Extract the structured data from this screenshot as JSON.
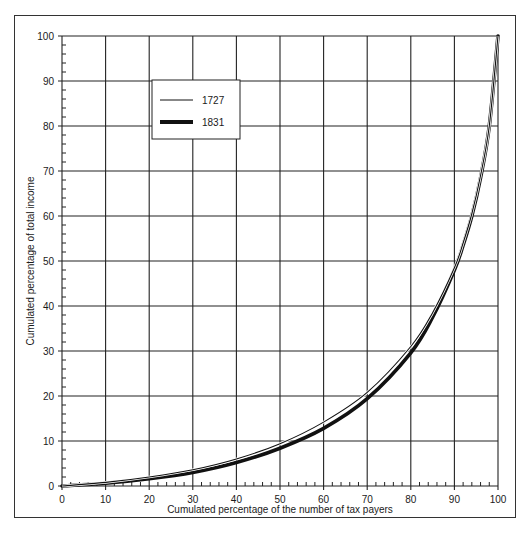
{
  "chart_data": {
    "type": "line",
    "title": "",
    "xlabel": "Cumulated percentage of the number of tax payers",
    "ylabel": "Cumulated percentage of total income",
    "xlim": [
      0,
      100
    ],
    "ylim": [
      0,
      100
    ],
    "grid": true,
    "x_ticks": [
      0,
      10,
      20,
      30,
      40,
      50,
      60,
      70,
      80,
      90,
      100
    ],
    "y_ticks": [
      0,
      10,
      20,
      30,
      40,
      50,
      60,
      70,
      80,
      90,
      100
    ],
    "legend_position": "upper-left (inside plot)",
    "x": [
      0,
      10,
      20,
      30,
      40,
      50,
      60,
      70,
      80,
      85,
      90,
      92,
      94,
      96,
      98,
      100
    ],
    "series": [
      {
        "name": "1727",
        "line_weight": "thin",
        "values": [
          0,
          0.8,
          2.0,
          3.6,
          6.0,
          9.4,
          14.2,
          20.8,
          31.0,
          38.5,
          48.5,
          54,
          60.5,
          69,
          80,
          100
        ]
      },
      {
        "name": "1831",
        "line_weight": "thick",
        "values": [
          0,
          0.6,
          1.6,
          3.0,
          5.2,
          8.4,
          12.8,
          19.4,
          29.6,
          37.5,
          48.0,
          53.5,
          60.0,
          68.5,
          80,
          100
        ]
      }
    ]
  },
  "axes": {
    "x_label": "Cumulated percentage of the number of tax payers",
    "y_label": "Cumulated percentage of total income",
    "x_tick_labels": [
      "0",
      "10",
      "20",
      "30",
      "40",
      "50",
      "60",
      "70",
      "80",
      "90",
      "100"
    ],
    "y_tick_labels": [
      "0",
      "10",
      "20",
      "30",
      "40",
      "50",
      "60",
      "70",
      "80",
      "90",
      "100"
    ]
  },
  "legend": {
    "items": [
      {
        "label": "1727",
        "style": "thin"
      },
      {
        "label": "1831",
        "style": "thick"
      }
    ]
  },
  "colors": {
    "line": "#111111",
    "grid": "#222222",
    "background": "#ffffff"
  }
}
